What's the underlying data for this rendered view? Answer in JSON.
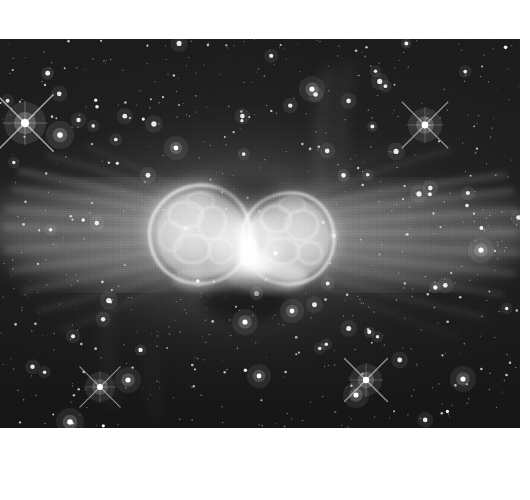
{
  "page": {
    "background_color": "#ffffff",
    "width": 530,
    "height": 500,
    "caption": ""
  },
  "plate": {
    "name": "ant-nebula-image",
    "alt_text": "Hubble Space Telescope grayscale image of the Ant Nebula Mz 3, a bipolar planetary nebula with two bright lobes and horizontal outflow filaments set against a dense star field",
    "x": 0,
    "y": 39,
    "width": 520,
    "height": 389,
    "sky_color": "#1b1b1b",
    "highlight_color": "#ffffff",
    "midtone_color": "#9a9a9a"
  },
  "chart_data": {
    "type": "scatter",
    "xlabel": "",
    "ylabel": "",
    "xlim": [
      0,
      520
    ],
    "ylim": [
      0,
      389
    ],
    "grid": false,
    "legend": "none",
    "nebula_core": {
      "center_x": 245,
      "center_y": 195,
      "lobes": [
        {
          "name": "west-lobe",
          "cx": 198,
          "cy": 190,
          "rx": 47,
          "ry": 44,
          "brightness": 0.92
        },
        {
          "name": "east-lobe",
          "cx": 287,
          "cy": 197,
          "rx": 46,
          "ry": 42,
          "brightness": 0.9
        },
        {
          "name": "waist",
          "cx": 245,
          "cy": 200,
          "rx": 16,
          "ry": 26,
          "brightness": 1.0
        }
      ],
      "outflows": [
        {
          "name": "west-outflow",
          "x0": 198,
          "x1": 10,
          "y": 192,
          "spread": 58,
          "brightness": 0.42
        },
        {
          "name": "east-outflow",
          "x0": 287,
          "x1": 512,
          "y": 196,
          "spread": 56,
          "brightness": 0.4
        }
      ]
    },
    "stars": [
      {
        "x": 25,
        "y": 84,
        "r": 4.2,
        "spikes": true,
        "mag": 1.0
      },
      {
        "x": 60,
        "y": 96,
        "r": 2.8,
        "spikes": false,
        "mag": 0.85
      },
      {
        "x": 425,
        "y": 86,
        "r": 3.4,
        "spikes": true,
        "mag": 0.95
      },
      {
        "x": 366,
        "y": 341,
        "r": 3.2,
        "spikes": true,
        "mag": 0.9
      },
      {
        "x": 356,
        "y": 356,
        "r": 2.6,
        "spikes": false,
        "mag": 0.8
      },
      {
        "x": 100,
        "y": 348,
        "r": 3.0,
        "spikes": true,
        "mag": 0.85
      },
      {
        "x": 128,
        "y": 341,
        "r": 2.6,
        "spikes": false,
        "mag": 0.8
      },
      {
        "x": 70,
        "y": 383,
        "r": 2.8,
        "spikes": false,
        "mag": 0.8
      },
      {
        "x": 245,
        "y": 283,
        "r": 2.6,
        "spikes": false,
        "mag": 0.8
      },
      {
        "x": 292,
        "y": 272,
        "r": 2.4,
        "spikes": false,
        "mag": 0.75
      },
      {
        "x": 176,
        "y": 109,
        "r": 2.4,
        "spikes": false,
        "mag": 0.75
      },
      {
        "x": 312,
        "y": 50,
        "r": 2.6,
        "spikes": false,
        "mag": 0.8
      },
      {
        "x": 481,
        "y": 211,
        "r": 2.6,
        "spikes": false,
        "mag": 0.78
      },
      {
        "x": 463,
        "y": 340,
        "r": 2.6,
        "spikes": false,
        "mag": 0.78
      },
      {
        "x": 259,
        "y": 337,
        "r": 2.4,
        "spikes": false,
        "mag": 0.75
      }
    ],
    "star_count_estimate": 640
  }
}
